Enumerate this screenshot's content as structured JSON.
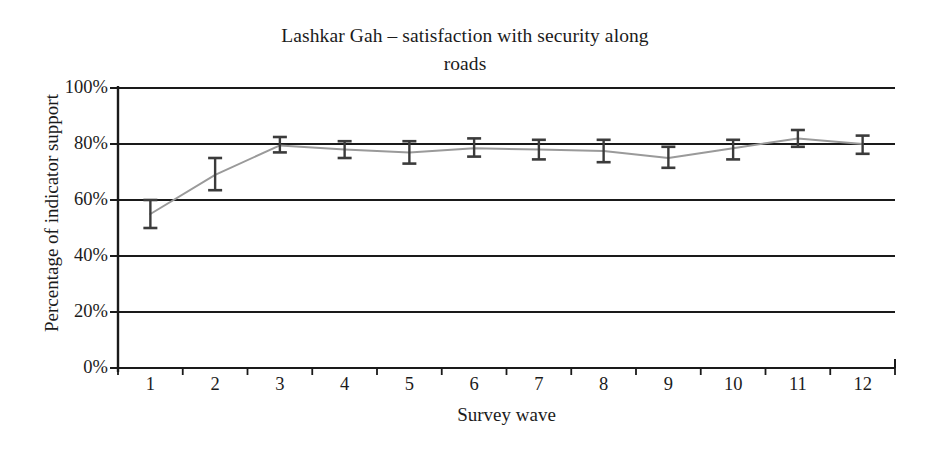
{
  "chart_data": {
    "type": "line",
    "title": "Lashkar Gah – satisfaction with security along roads",
    "title_line1": "Lashkar Gah – satisfaction with security along",
    "title_line2": "roads",
    "xlabel": "Survey wave",
    "ylabel": "Percentage of indicator support",
    "categories": [
      "1",
      "2",
      "3",
      "4",
      "5",
      "6",
      "7",
      "8",
      "9",
      "10",
      "11",
      "12"
    ],
    "x": [
      1,
      2,
      3,
      4,
      5,
      6,
      7,
      8,
      9,
      10,
      11,
      12
    ],
    "values": [
      55,
      69,
      79.5,
      78,
      77,
      78.5,
      78,
      77.5,
      75,
      78.5,
      82,
      80
    ],
    "error_low": [
      50,
      63.5,
      77,
      75,
      73,
      75.5,
      74.5,
      73.5,
      71.5,
      74.5,
      79,
      76.5
    ],
    "error_high": [
      60,
      75,
      82.5,
      81,
      81,
      82,
      81.5,
      81.5,
      79,
      81.5,
      85,
      83
    ],
    "ylim": [
      0,
      100
    ],
    "ytick_values": [
      0,
      20,
      40,
      60,
      80,
      100
    ],
    "ytick_labels": [
      "0%",
      "20%",
      "40%",
      "60%",
      "80%",
      "100%"
    ],
    "grid": true,
    "grid_axis": "y",
    "legend": "none",
    "series_name": "Percentage of indicator support",
    "colors": {
      "line": "#9a9a9a",
      "error_bar": "#3b3b3b",
      "grid": "#1a1a1a",
      "axis": "#1a1a1a",
      "text": "#1b1b1b",
      "background": "#ffffff"
    }
  }
}
